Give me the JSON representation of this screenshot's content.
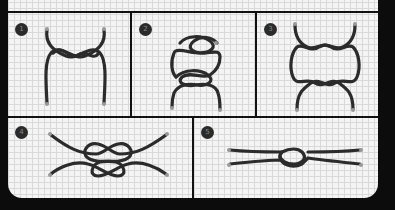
{
  "diagram": {
    "title": "",
    "panels": [
      {
        "step": "1",
        "description": "two ropes crossed with single twists"
      },
      {
        "step": "2",
        "description": "loops formed with two crossings"
      },
      {
        "step": "3",
        "description": "symmetric double crossings"
      },
      {
        "step": "4",
        "description": "knot drawn loosely"
      },
      {
        "step": "5",
        "description": "knot tightened"
      }
    ],
    "colors": {
      "background": "#0c0c0c",
      "card": "#f4f4f4",
      "grid": "#d9d9d9",
      "rope": "#2b2b2b",
      "badge": "#2a2a2a"
    }
  }
}
